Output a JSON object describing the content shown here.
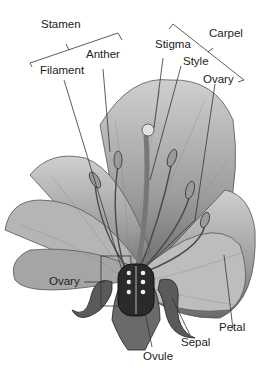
{
  "labels": {
    "stamen": "Stamen",
    "anther": "Anther",
    "filament": "Filament",
    "stigma": "Stigma",
    "carpel": "Carpel",
    "style": "Style",
    "ovary_top": "Ovary",
    "ovary_left": "Ovary",
    "petal": "Petal",
    "sepal": "Sepal",
    "ovule": "Ovule"
  },
  "colors": {
    "petal_light": "#d8d8d8",
    "petal_mid": "#a8a8a8",
    "petal_dark": "#555555",
    "line": "#333333"
  }
}
